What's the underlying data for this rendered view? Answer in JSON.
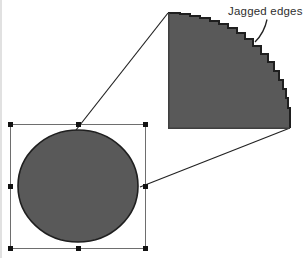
{
  "figure": {
    "annotation": {
      "label": "Jagged edges"
    },
    "colors": {
      "background": "#ffffff",
      "shape_fill": "#595959",
      "shape_edge": "#1f1f1f",
      "shape_edge_soft": "#3f3f3f",
      "selection_outline": "#6e6e6e",
      "handle": "#121212",
      "callout_line": "#222222",
      "label_text": "#2f2f2f",
      "page_edge": "#d9d9d9"
    }
  }
}
